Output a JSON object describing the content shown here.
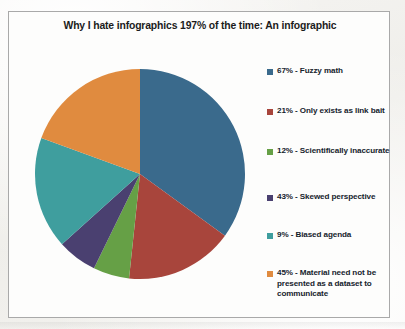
{
  "chart_data": {
    "type": "pie",
    "title": "Why I hate infographics 197% of the time: An infographic",
    "legend_position": "right",
    "categories": [
      "Fuzzy math",
      "Only exists as link bait",
      "Scientifically inaccurate",
      "Skewed perspective",
      "Biased agenda",
      "Material need not be presented as a dataset to communicate"
    ],
    "values": [
      67,
      21,
      12,
      43,
      9,
      45
    ],
    "value_suffix": "%",
    "total": 197,
    "colors": [
      "#3a6a8c",
      "#a8453c",
      "#66a046",
      "#4a4070",
      "#3f9e9e",
      "#e08b3f"
    ],
    "rendered_sweep_degrees": [
      126,
      60,
      20,
      22,
      62,
      70
    ],
    "slices": [
      {
        "label": "Fuzzy math",
        "value": 67,
        "display": "67% - Fuzzy math",
        "color": "#3a6a8c"
      },
      {
        "label": "Only exists as link bait",
        "value": 21,
        "display": "21% - Only exists as link bait",
        "color": "#a8453c"
      },
      {
        "label": "Scientifically inaccurate",
        "value": 12,
        "display": "12%  - Scientifically inaccurate",
        "color": "#66a046"
      },
      {
        "label": "Skewed perspective",
        "value": 43,
        "display": "43% - Skewed perspective",
        "color": "#4a4070"
      },
      {
        "label": "Biased agenda",
        "value": 9,
        "display": "9% - Biased agenda",
        "color": "#3f9e9e"
      },
      {
        "label": "Material need not be presented as a dataset to communicate",
        "value": 45,
        "display": "45% - Material need not be presented as a dataset to communicate",
        "color": "#e08b3f"
      }
    ]
  },
  "legend": {
    "items": [
      {
        "text": "67% - Fuzzy math",
        "color": "#3a6a8c"
      },
      {
        "text": "21% - Only exists as link bait",
        "color": "#a8453c"
      },
      {
        "text": "12%  - Scientifically inaccurate",
        "color": "#66a046"
      },
      {
        "text": "43% - Skewed perspective",
        "color": "#4a4070"
      },
      {
        "text": "9% - Biased agenda",
        "color": "#3f9e9e"
      },
      {
        "text": "45% - Material need not be presented as a dataset to communicate",
        "color": "#e08b3f"
      }
    ]
  }
}
